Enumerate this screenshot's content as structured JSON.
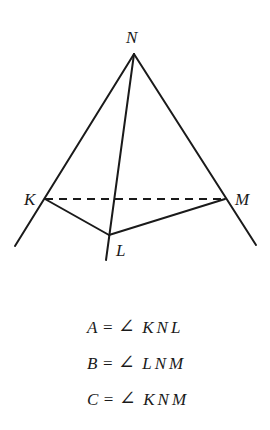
{
  "diagram": {
    "type": "tetrahedron-angles",
    "points": {
      "N": {
        "label": "N",
        "x": 134,
        "y": 54
      },
      "K": {
        "label": "K",
        "x": 45,
        "y": 199
      },
      "M": {
        "label": "M",
        "x": 225,
        "y": 199
      },
      "L": {
        "label": "L",
        "x": 109,
        "y": 235
      }
    },
    "solid_edges": [
      "NK",
      "NM",
      "NL",
      "KL",
      "LM"
    ],
    "dashed_edges": [
      "KM"
    ],
    "stroke_color": "#1a1a1a"
  },
  "labels": {
    "N": "N",
    "K": "K",
    "M": "M",
    "L": "L"
  },
  "equations": [
    {
      "var": "A",
      "equals": "=",
      "angle_symbol": "∠",
      "points": "KNL"
    },
    {
      "var": "B",
      "equals": "=",
      "angle_symbol": "∠",
      "points": "LNM"
    },
    {
      "var": "C",
      "equals": "=",
      "angle_symbol": "∠",
      "points": "KNM"
    }
  ]
}
